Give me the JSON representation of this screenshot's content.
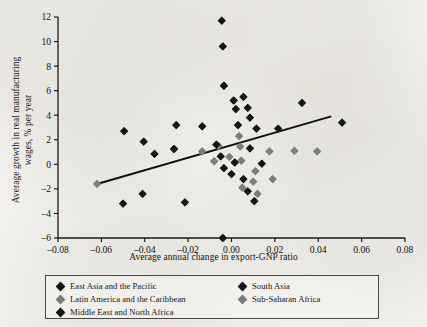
{
  "chart_data": {
    "type": "scatter",
    "title": "",
    "xlabel": "Average annual change in export-GNP ratio",
    "ylabel_line1": "Average growth in real manufacturing",
    "ylabel_line2": "wages, % per year",
    "xlim": [
      -0.08,
      0.08
    ],
    "ylim": [
      -6,
      12
    ],
    "xticks": [
      -0.08,
      -0.06,
      -0.04,
      -0.02,
      0.0,
      0.02,
      0.04,
      0.06,
      0.08
    ],
    "xticklabels": [
      "–0.08",
      "–0.06",
      "–0.04",
      "–0.02",
      "0.00",
      "0.02",
      "0.04",
      "0.06",
      "0.08"
    ],
    "yticks": [
      -6,
      -4,
      -2,
      0,
      2,
      4,
      6,
      8,
      10,
      12
    ],
    "yticklabels": [
      "–6",
      "–4",
      "–2",
      "0",
      "2",
      "4",
      "6",
      "8",
      "10",
      "12"
    ],
    "grid": false,
    "legend_position": "below-axes",
    "trendline": {
      "label": "fitted regression line",
      "x_start": -0.062,
      "y_start": -1.6,
      "x_end": 0.046,
      "y_end": 3.9,
      "color": "#111111"
    },
    "series": [
      {
        "name": "East Asia and the Pacific",
        "color": "#141414",
        "points": [
          [
            -0.0495,
            2.7
          ],
          [
            -0.0405,
            1.85
          ],
          [
            -0.0355,
            0.85
          ],
          [
            -0.0265,
            1.25
          ],
          [
            -0.0255,
            3.2
          ],
          [
            -0.0135,
            3.1
          ],
          [
            -0.005,
            0.65
          ],
          [
            -0.0045,
            11.7
          ],
          [
            -0.004,
            9.6
          ],
          [
            -0.0035,
            6.4
          ],
          [
            0.001,
            5.2
          ],
          [
            0.002,
            4.5
          ],
          [
            0.0055,
            5.5
          ],
          [
            0.0075,
            4.6
          ],
          [
            0.0085,
            3.8
          ],
          [
            0.003,
            3.2
          ],
          [
            0.0115,
            2.9
          ],
          [
            0.0215,
            2.9
          ],
          [
            0.0325,
            5.0
          ],
          [
            0.051,
            3.4
          ]
        ]
      },
      {
        "name": "Latin America and the Caribbean",
        "color": "#7d7d7d",
        "points": [
          [
            -0.062,
            -1.6
          ],
          [
            -0.0135,
            1.05
          ],
          [
            -0.006,
            1.5
          ],
          [
            -0.001,
            0.6
          ],
          [
            0.0035,
            2.3
          ],
          [
            0.0045,
            0.3
          ],
          [
            0.01,
            -1.4
          ],
          [
            0.012,
            -2.4
          ],
          [
            0.0175,
            1.05
          ],
          [
            0.029,
            1.1
          ],
          [
            0.0395,
            1.05
          ]
        ]
      },
      {
        "name": "Middle East and North Africa",
        "color": "#141414",
        "points": [
          [
            -0.05,
            -3.2
          ],
          [
            -0.041,
            -2.4
          ],
          [
            -0.0215,
            -3.1
          ],
          [
            -0.0035,
            -0.3
          ],
          [
            0.0,
            -0.8
          ],
          [
            0.0055,
            -1.2
          ],
          [
            0.0075,
            -2.2
          ],
          [
            0.0105,
            -3.0
          ],
          [
            -0.004,
            -6.0
          ]
        ]
      },
      {
        "name": "South Asia",
        "color": "#141414",
        "points": [
          [
            -0.007,
            1.6
          ],
          [
            0.0015,
            0.15
          ],
          [
            0.0085,
            1.3
          ],
          [
            0.014,
            0.05
          ]
        ]
      },
      {
        "name": "Sub-Saharan Africa",
        "color": "#7d7d7d",
        "points": [
          [
            -0.008,
            0.25
          ],
          [
            0.004,
            1.45
          ],
          [
            0.011,
            -0.55
          ],
          [
            0.019,
            -1.2
          ],
          [
            0.005,
            -1.9
          ]
        ]
      }
    ]
  },
  "legend": {
    "entries": [
      {
        "label": "East Asia and the Pacific",
        "color": "#141414",
        "column": 0,
        "row": 0
      },
      {
        "label": "Latin America and the Caribbean",
        "color": "#7d7d7d",
        "column": 0,
        "row": 1
      },
      {
        "label": "Middle East and North Africa",
        "color": "#141414",
        "column": 0,
        "row": 2
      },
      {
        "label": "South Asia",
        "color": "#141414",
        "column": 1,
        "row": 0
      },
      {
        "label": "Sub-Saharan Africa",
        "color": "#7d7d7d",
        "column": 1,
        "row": 1
      }
    ]
  }
}
